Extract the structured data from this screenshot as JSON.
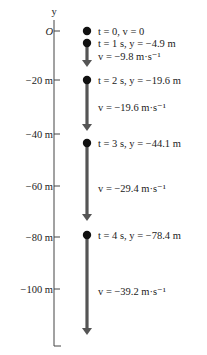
{
  "axis": {
    "label": "y",
    "origin_label": "O",
    "ticks": [
      {
        "label": "O",
        "value": 0,
        "y": 31
      },
      {
        "label": "−20 m",
        "value": -20,
        "y": 80
      },
      {
        "label": "−40 m",
        "value": -40,
        "y": 134
      },
      {
        "label": "−60 m",
        "value": -60,
        "y": 186
      },
      {
        "label": "−80 m",
        "value": -80,
        "y": 237
      },
      {
        "label": "−100 m",
        "value": -100,
        "y": 289
      }
    ]
  },
  "positions": [
    {
      "t": "t = 0, v = 0",
      "y": 31
    },
    {
      "t": "t = 1 s, y = −4.9 m",
      "y": 43
    },
    {
      "t": "t = 2 s, y = −19.6 m",
      "y": 80
    },
    {
      "t": "t = 3 s, y = −44.1 m",
      "y": 143
    },
    {
      "t": "t = 4 s, y = −78.4 m",
      "y": 235
    }
  ],
  "velocities": [
    {
      "label": "v = −9.8 m·s⁻¹",
      "from": 43,
      "to": 66,
      "text_y": 56
    },
    {
      "label": "v = −19.6 m·s⁻¹",
      "from": 80,
      "to": 130,
      "text_y": 107
    },
    {
      "label": "v = −29.4 m·s⁻¹",
      "from": 143,
      "to": 220,
      "text_y": 188
    },
    {
      "label": "v = −39.2 m·s⁻¹",
      "from": 235,
      "to": 334,
      "text_y": 291
    }
  ],
  "colors": {
    "dot": "#111111",
    "arrow": "#555555",
    "axis": "#444444"
  }
}
